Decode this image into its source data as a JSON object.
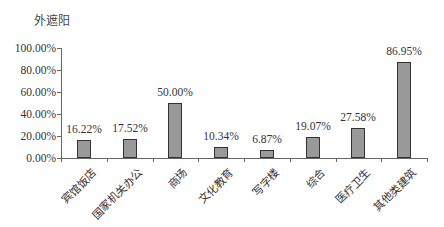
{
  "chart_data": {
    "type": "bar",
    "title": "外遮阳",
    "xlabel": "",
    "ylabel": "",
    "ylim": [
      0,
      100
    ],
    "yticks": [
      "0.00%",
      "20.00%",
      "40.00%",
      "60.00%",
      "80.00%",
      "100.00%"
    ],
    "categories": [
      "宾馆饭店",
      "国家机关办公",
      "商场",
      "文化教育",
      "写字楼",
      "综合",
      "医疗卫生",
      "其他类建筑"
    ],
    "values": [
      16.22,
      17.52,
      50.0,
      10.34,
      6.87,
      19.07,
      27.58,
      86.95
    ],
    "data_labels": [
      "16.22%",
      "17.52%",
      "50.00%",
      "10.34%",
      "6.87%",
      "19.07%",
      "27.58%",
      "86.95%"
    ],
    "grid": false,
    "legend": null,
    "bar_color": "#999999",
    "bar_border_color": "#333333"
  }
}
